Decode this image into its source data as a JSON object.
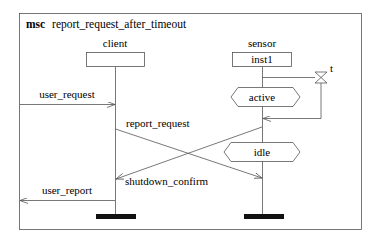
{
  "diagram": {
    "type": "msc",
    "keyword": "msc",
    "name": "report_request_after_timeout",
    "instances": [
      {
        "name": "client",
        "box_label": ""
      },
      {
        "name": "sensor",
        "box_label": "inst1"
      }
    ],
    "timer": {
      "label": "t"
    },
    "conditions": [
      {
        "label": "active"
      },
      {
        "label": "idle"
      }
    ],
    "messages": [
      {
        "label": "user_request",
        "from": "environment",
        "to": "client"
      },
      {
        "label": "report_request",
        "from": "client",
        "to": "sensor"
      },
      {
        "label": "shutdown_confirm",
        "from": "sensor",
        "to": "client"
      },
      {
        "label": "user_report",
        "from": "client",
        "to": "environment"
      }
    ]
  }
}
